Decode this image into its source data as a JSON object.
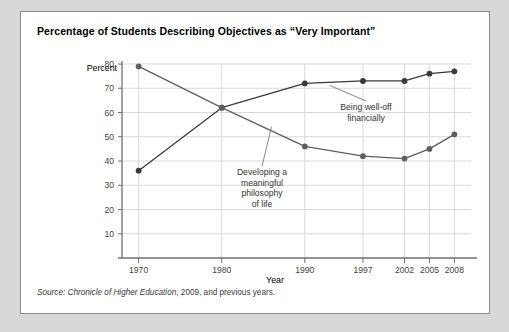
{
  "figure": {
    "title": "Percentage of Students Describing Objectives as “Very Important”",
    "source_lead": "Source:",
    "source_italic": " Chronicle of Higher Education",
    "source_rest": ", 2009, and previous years.",
    "panel_border_color": "#8a8a8a",
    "panel_background": "#ffffff",
    "page_background": "#d8d8d8"
  },
  "chart_data": {
    "type": "line",
    "title": "Percentage of Students Describing Objectives as “Very Important”",
    "xlabel": "Year",
    "ylabel": "Percent",
    "categories": [
      "1970",
      "1980",
      "1990",
      "1997",
      "2002",
      "2005",
      "2008"
    ],
    "x": [
      1970,
      1980,
      1990,
      1997,
      2002,
      2005,
      2008
    ],
    "xlim": [
      1968,
      2010
    ],
    "ylim": [
      0,
      80
    ],
    "yticks": [
      10,
      20,
      30,
      40,
      50,
      60,
      70,
      80
    ],
    "ytick_labels": [
      "10",
      "20",
      "30",
      "40",
      "50",
      "60",
      "70",
      "80"
    ],
    "grid": true,
    "grid_color": "#d9d9d9",
    "legend": "annotations",
    "series": [
      {
        "name": "Being well-off financially",
        "color": "#3a3a3a",
        "marker": "circle",
        "values": [
          36,
          62,
          72,
          73,
          73,
          76,
          77
        ]
      },
      {
        "name": "Developing a meaningful philosophy of life",
        "color": "#5f5f5f",
        "marker": "circle",
        "values": [
          79,
          62,
          46,
          42,
          41,
          45,
          51
        ]
      }
    ],
    "annotations": [
      {
        "name": "being-well-off-financially",
        "lines": [
          "Being well-off",
          "financially"
        ],
        "points_to_year": 1993,
        "points_to_value": 72
      },
      {
        "name": "developing-philosophy-of-life",
        "lines": [
          "Developing a",
          "meaningful",
          "philosophy",
          "of life"
        ],
        "points_to_year": 1986,
        "points_to_value": 55
      }
    ]
  }
}
